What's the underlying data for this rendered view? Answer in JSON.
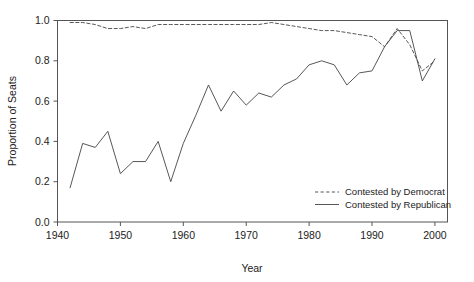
{
  "chart_data": {
    "type": "line",
    "title": "",
    "xlabel": "Year",
    "ylabel": "Proportion of Seats",
    "xlim": [
      1940,
      2002
    ],
    "ylim": [
      0.0,
      1.0
    ],
    "grid": false,
    "legend_position": "bottom-right",
    "x": [
      1942,
      1944,
      1946,
      1948,
      1950,
      1952,
      1954,
      1956,
      1958,
      1960,
      1962,
      1964,
      1966,
      1968,
      1970,
      1972,
      1974,
      1976,
      1978,
      1980,
      1982,
      1984,
      1986,
      1988,
      1990,
      1992,
      1994,
      1996,
      1998,
      2000
    ],
    "xticks": [
      1940,
      1950,
      1960,
      1970,
      1980,
      1990,
      2000
    ],
    "xticklabels": [
      "1940",
      "1950",
      "1960",
      "1970",
      "1980",
      "1990",
      "2000"
    ],
    "yticks": [
      0.0,
      0.2,
      0.4,
      0.6,
      0.8,
      1.0
    ],
    "yticklabels": [
      "0.0",
      "0.2",
      "0.4",
      "0.6",
      "0.8",
      "1.0"
    ],
    "series": [
      {
        "name": "Contested by Democrat",
        "style": "dashed",
        "color": "#444444",
        "values": [
          0.99,
          0.99,
          0.98,
          0.96,
          0.96,
          0.97,
          0.96,
          0.98,
          0.98,
          0.98,
          0.98,
          0.98,
          0.98,
          0.98,
          0.98,
          0.98,
          0.99,
          0.98,
          0.97,
          0.96,
          0.95,
          0.95,
          0.94,
          0.93,
          0.92,
          0.87,
          0.96,
          0.88,
          0.75,
          0.8
        ]
      },
      {
        "name": "Contested by Republican",
        "style": "solid",
        "color": "#444444",
        "values": [
          0.17,
          0.39,
          0.37,
          0.45,
          0.24,
          0.3,
          0.3,
          0.4,
          0.2,
          0.39,
          0.53,
          0.68,
          0.55,
          0.65,
          0.58,
          0.64,
          0.62,
          0.68,
          0.71,
          0.78,
          0.8,
          0.78,
          0.68,
          0.74,
          0.75,
          0.87,
          0.95,
          0.95,
          0.7,
          0.81
        ]
      }
    ]
  },
  "legend": {
    "entries": [
      {
        "label": "Contested by Democrat",
        "style": "dashed"
      },
      {
        "label": "Contested by Republican",
        "style": "solid"
      }
    ]
  }
}
